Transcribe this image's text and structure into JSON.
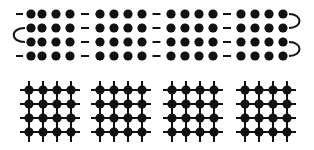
{
  "diagram": {
    "colors": {
      "ink": "#111111",
      "background": "#ffffff"
    },
    "top_panel": {
      "description": "four 4x4 dot arrays linked by horizontal dashes, with end connectors",
      "rows_y": [
        14,
        28,
        42,
        56
      ],
      "groups": [
        {
          "dots_x": [
            31,
            42,
            56,
            70
          ]
        },
        {
          "dots_x": [
            100,
            114,
            128,
            142
          ]
        },
        {
          "dots_x": [
            171,
            185,
            199,
            213
          ]
        },
        {
          "dots_x": [
            241,
            255,
            269,
            283
          ]
        }
      ],
      "left_dashes_rows": [
        0,
        3
      ],
      "left_connector": {
        "type": "arc-left",
        "rows": [
          1,
          2
        ],
        "x": 14
      },
      "right_connectors": [
        {
          "type": "arc-right",
          "rows": [
            0,
            1
          ]
        },
        {
          "type": "arc-right",
          "rows": [
            2,
            3
          ]
        }
      ]
    },
    "bottom_panel": {
      "description": "four 4x4 lattice grids of dots with crossing lines",
      "rows_y": [
        90,
        104,
        118,
        132
      ],
      "groups": [
        {
          "dots_x": [
            29,
            43,
            57,
            71
          ]
        },
        {
          "dots_x": [
            100,
            114,
            128,
            142
          ]
        },
        {
          "dots_x": [
            172,
            186,
            200,
            214
          ]
        },
        {
          "dots_x": [
            245,
            259,
            273,
            287
          ]
        }
      ]
    }
  }
}
